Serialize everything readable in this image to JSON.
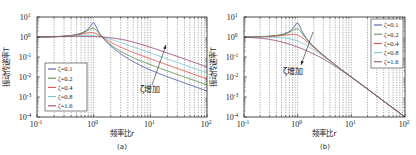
{
  "chart_data": [
    {
      "panel": "a",
      "type": "line",
      "caption": "(a)",
      "xlabel": "频率比r",
      "ylabel": "振动传递率T",
      "xscale": "log",
      "yscale": "log",
      "xlim": [
        0.1,
        100
      ],
      "ylim": [
        0.0001,
        10
      ],
      "xticks": [
        {
          "v": 0.1,
          "base": "10",
          "exp": "-1"
        },
        {
          "v": 1,
          "base": "10",
          "exp": "0"
        },
        {
          "v": 10,
          "base": "10",
          "exp": "1"
        },
        {
          "v": 100,
          "base": "10",
          "exp": "2"
        }
      ],
      "yticks": [
        {
          "v": 10,
          "base": "10",
          "exp": "1"
        },
        {
          "v": 1,
          "base": "10",
          "exp": "0"
        },
        {
          "v": 0.1,
          "base": "10",
          "exp": "-1"
        },
        {
          "v": 0.01,
          "base": "10",
          "exp": "-2"
        },
        {
          "v": 0.001,
          "base": "10",
          "exp": "-3"
        },
        {
          "v": 0.0001,
          "base": "10",
          "exp": "-4"
        }
      ],
      "grid": "vertical dashed at minor log ticks",
      "legend_position": "lower-left",
      "model": "T = sqrt((1+(2ζr)^2)/((1-r^2)^2+(2ζr)^2))",
      "annotation": {
        "text": "ζ增加",
        "direction": "arrow up-right (T increases with ζ at high r)"
      },
      "series": [
        {
          "name": "ζ=0.1",
          "zeta": 0.1,
          "color": "#3a4fa0",
          "points": [
            [
              0.1,
              1.01
            ],
            [
              0.5,
              1.33
            ],
            [
              1,
              5.1
            ],
            [
              2,
              0.34
            ],
            [
              10,
              0.0104
            ],
            [
              100,
              0.00204
            ]
          ]
        },
        {
          "name": "ζ=0.2",
          "zeta": 0.2,
          "color": "#4a8a3a",
          "points": [
            [
              0.1,
              1.01
            ],
            [
              0.5,
              1.32
            ],
            [
              1,
              2.69
            ],
            [
              2,
              0.39
            ],
            [
              10,
              0.0106
            ],
            [
              100,
              0.00401
            ]
          ]
        },
        {
          "name": "ζ=0.4",
          "zeta": 0.4,
          "color": "#e0473a",
          "points": [
            [
              0.1,
              1.01
            ],
            [
              0.5,
              1.28
            ],
            [
              1,
              1.6
            ],
            [
              2,
              0.52
            ],
            [
              10,
              0.0818
            ],
            [
              100,
              0.008
            ]
          ]
        },
        {
          "name": "ζ=0.8",
          "zeta": 0.8,
          "color": "#6cc4c8",
          "points": [
            [
              0.1,
              1.01
            ],
            [
              0.5,
              1.16
            ],
            [
              1,
              1.18
            ],
            [
              2,
              0.72
            ],
            [
              10,
              0.159
            ],
            [
              100,
              0.016
            ]
          ]
        },
        {
          "name": "ζ=1.6",
          "zeta": 1.6,
          "color": "#8a3a6a",
          "points": [
            [
              0.1,
              1.01
            ],
            [
              0.5,
              1.05
            ],
            [
              1,
              1.05
            ],
            [
              2,
              0.87
            ],
            [
              10,
              0.305
            ],
            [
              100,
              0.032
            ]
          ]
        }
      ]
    },
    {
      "panel": "b",
      "type": "line",
      "caption": "(b)",
      "xlabel": "频率比r",
      "ylabel": "振动传递率T",
      "xscale": "log",
      "yscale": "log",
      "xlim": [
        0.1,
        100
      ],
      "ylim": [
        0.0001,
        10
      ],
      "xticks": [
        {
          "v": 0.1,
          "base": "10",
          "exp": "-1"
        },
        {
          "v": 1,
          "base": "10",
          "exp": "0"
        },
        {
          "v": 10,
          "base": "10",
          "exp": "1"
        },
        {
          "v": 100,
          "base": "10",
          "exp": "2"
        }
      ],
      "yticks": [
        {
          "v": 10,
          "base": "10",
          "exp": "1"
        },
        {
          "v": 1,
          "base": "10",
          "exp": "0"
        },
        {
          "v": 0.1,
          "base": "10",
          "exp": "-1"
        },
        {
          "v": 0.01,
          "base": "10",
          "exp": "-2"
        },
        {
          "v": 0.001,
          "base": "10",
          "exp": "-3"
        },
        {
          "v": 0.0001,
          "base": "10",
          "exp": "-4"
        }
      ],
      "grid": "vertical dashed at minor log ticks",
      "legend_position": "top-right",
      "model": "T = 1/sqrt((1-r^2)^2+(2ζr)^2)",
      "annotation": {
        "text": "ζ增加",
        "direction": "arrow down (peak decreases with ζ)"
      },
      "series": [
        {
          "name": "ζ=0.1",
          "zeta": 0.1,
          "color": "#3a4fa0",
          "points": [
            [
              0.1,
              1.01
            ],
            [
              0.5,
              1.33
            ],
            [
              1,
              5.0
            ],
            [
              2,
              0.33
            ],
            [
              10,
              0.0101
            ],
            [
              100,
              0.0001
            ]
          ]
        },
        {
          "name": "ζ=0.2",
          "zeta": 0.2,
          "color": "#4a8a3a",
          "points": [
            [
              0.1,
              1.01
            ],
            [
              0.5,
              1.31
            ],
            [
              1,
              2.5
            ],
            [
              2,
              0.32
            ],
            [
              10,
              0.0101
            ],
            [
              100,
              0.0001
            ]
          ]
        },
        {
          "name": "ζ=0.4",
          "zeta": 0.4,
          "color": "#e0473a",
          "points": [
            [
              0.1,
              1.01
            ],
            [
              0.5,
              1.25
            ],
            [
              1,
              1.25
            ],
            [
              2,
              0.3
            ],
            [
              10,
              0.0101
            ],
            [
              100,
              0.0001
            ]
          ]
        },
        {
          "name": "ζ=0.8",
          "zeta": 0.8,
          "color": "#6cc4c8",
          "points": [
            [
              0.1,
              1.0
            ],
            [
              0.5,
              0.98
            ],
            [
              1,
              0.625
            ],
            [
              2,
              0.25
            ],
            [
              10,
              0.01
            ],
            [
              100,
              0.0001
            ]
          ]
        },
        {
          "name": "ζ=1.6",
          "zeta": 1.6,
          "color": "#8a3a6a",
          "points": [
            [
              0.1,
              0.99
            ],
            [
              0.5,
              0.57
            ],
            [
              1,
              0.31
            ],
            [
              2,
              0.17
            ],
            [
              10,
              0.0096
            ],
            [
              100,
              0.0001
            ]
          ]
        }
      ]
    }
  ]
}
